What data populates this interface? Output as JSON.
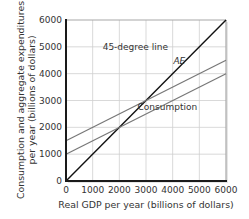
{
  "chart_data": {
    "type": "line",
    "title": "",
    "xlabel": "Real GDP per year (billions of dollars)",
    "ylabel_line1": "Consumption and aggregate expenditures",
    "ylabel_line2": "per year (billions of dollars)",
    "xlim": [
      0,
      6000
    ],
    "ylim": [
      0,
      6000
    ],
    "xticks": [
      0,
      1000,
      2000,
      3000,
      4000,
      5000,
      6000
    ],
    "yticks": [
      0,
      1000,
      2000,
      3000,
      4000,
      5000,
      6000
    ],
    "grid": true,
    "series": [
      {
        "name": "45-degree line",
        "x": [
          0,
          6000
        ],
        "y": [
          0,
          6000
        ],
        "color": "#111111",
        "width": 1.4,
        "label": {
          "text": "45-degree line",
          "x": 2600,
          "y": 4900,
          "italic": false
        }
      },
      {
        "name": "AE",
        "x": [
          0,
          6000
        ],
        "y": [
          1500,
          4500
        ],
        "color": "#777777",
        "width": 1.2,
        "label": {
          "text": "AE",
          "x": 4250,
          "y": 4350,
          "italic": true
        }
      },
      {
        "name": "Consumption",
        "x": [
          0,
          6000
        ],
        "y": [
          1000,
          4000
        ],
        "color": "#777777",
        "width": 1.2,
        "label": {
          "text": "Consumption",
          "x": 3800,
          "y": 2650,
          "italic": false
        }
      }
    ],
    "colors": {
      "axis": "#1a1a1a",
      "grid": "#cfcfcf",
      "frame": "#a8a8a8",
      "text": "#333333"
    }
  }
}
